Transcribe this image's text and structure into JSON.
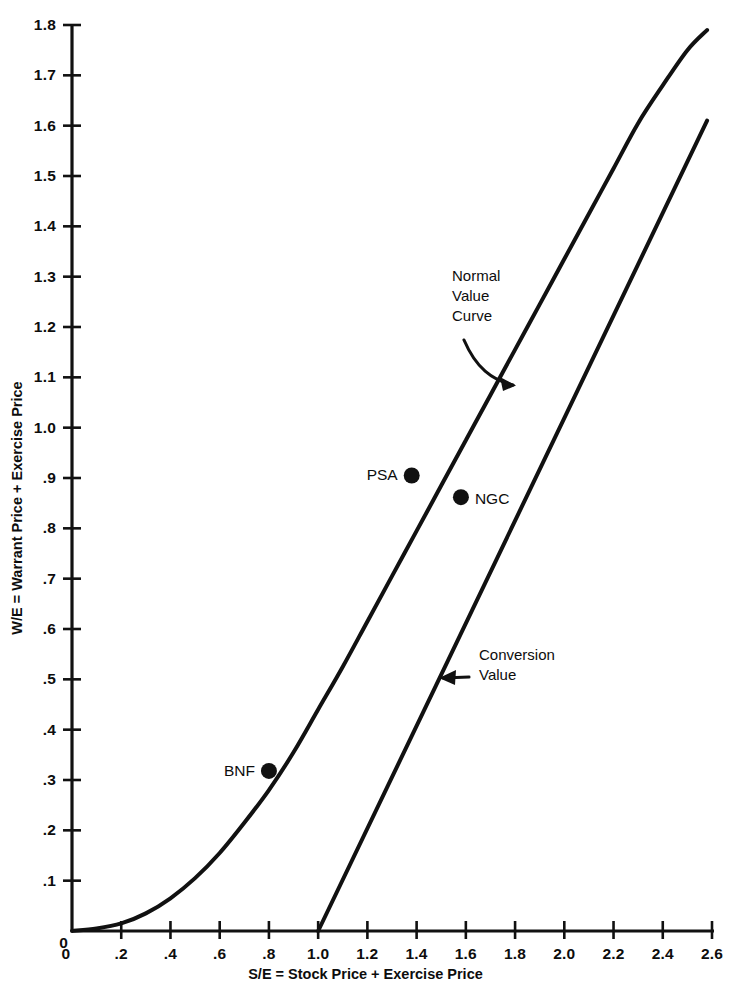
{
  "chart_data": {
    "type": "line",
    "title": "",
    "xlabel": "S/E = Stock Price + Exercise Price",
    "ylabel": "W/E = Warrant Price + Exercise Price",
    "xlim": [
      0,
      2.6
    ],
    "ylim": [
      0,
      1.8
    ],
    "grid": false,
    "legend_position": "inline-annotations",
    "xticks": [
      "0",
      ".2",
      ".4",
      ".6",
      ".8",
      "1.0",
      "1.2",
      "1.4",
      "1.6",
      "1.8",
      "2.0",
      "2.2",
      "2.4",
      "2.6"
    ],
    "xtick_values": [
      0,
      0.2,
      0.4,
      0.6,
      0.8,
      1.0,
      1.2,
      1.4,
      1.6,
      1.8,
      2.0,
      2.2,
      2.4,
      2.6
    ],
    "yticks": [
      "0",
      ".1",
      ".2",
      ".3",
      ".4",
      ".5",
      ".6",
      ".7",
      ".8",
      ".9",
      "1.0",
      "1.1",
      "1.2",
      "1.3",
      "1.4",
      "1.5",
      "1.6",
      "1.7",
      "1.8"
    ],
    "ytick_values": [
      0,
      0.1,
      0.2,
      0.3,
      0.4,
      0.5,
      0.6,
      0.7,
      0.8,
      0.9,
      1.0,
      1.1,
      1.2,
      1.3,
      1.4,
      1.5,
      1.6,
      1.7,
      1.8
    ],
    "series": [
      {
        "name": "Normal Value Curve",
        "x": [
          0.0,
          0.1,
          0.2,
          0.3,
          0.4,
          0.5,
          0.6,
          0.7,
          0.8,
          0.9,
          1.0,
          1.1,
          1.2,
          1.3,
          1.4,
          1.5,
          1.6,
          1.7,
          1.8,
          1.9,
          2.0,
          2.1,
          2.2,
          2.3,
          2.4,
          2.5,
          2.58
        ],
        "y": [
          0.0,
          0.005,
          0.015,
          0.035,
          0.065,
          0.105,
          0.155,
          0.215,
          0.28,
          0.355,
          0.44,
          0.525,
          0.615,
          0.705,
          0.795,
          0.885,
          0.975,
          1.065,
          1.155,
          1.245,
          1.335,
          1.425,
          1.515,
          1.605,
          1.68,
          1.75,
          1.79
        ]
      },
      {
        "name": "Conversion Value",
        "x": [
          1.0,
          2.58
        ],
        "y": [
          0.0,
          1.61
        ]
      }
    ],
    "points": [
      {
        "label": "BNF",
        "x": 0.8,
        "y": 0.318,
        "label_side": "left"
      },
      {
        "label": "PSA",
        "x": 1.38,
        "y": 0.905,
        "label_side": "left"
      },
      {
        "label": "NGC",
        "x": 1.58,
        "y": 0.862,
        "label_side": "right"
      }
    ],
    "annotations": [
      {
        "text": "Normal\nValue\nCurve",
        "x_px": 452,
        "y_px": 266,
        "arrow": "curve-down-right"
      },
      {
        "text": "Conversion\nValue",
        "x_px": 479,
        "y_px": 645,
        "arrow": "left"
      }
    ],
    "colors": {
      "line": "#111111",
      "axis": "#111111",
      "point": "#111111",
      "background": "#ffffff",
      "text": "#0d0d0d"
    }
  }
}
